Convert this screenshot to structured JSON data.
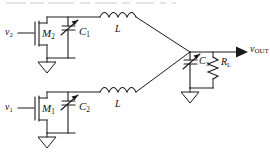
{
  "diagram": {
    "type": "circuit-schematic",
    "background_color": "#ffffff",
    "line_color": "#1a1a1a"
  },
  "inputs": [
    {
      "id": "v2",
      "label_main": "v",
      "label_sub": "2",
      "position": "top-left"
    },
    {
      "id": "v1",
      "label_main": "v",
      "label_sub": "1",
      "position": "bottom-left"
    }
  ],
  "transistors": [
    {
      "id": "M2",
      "label_main": "M",
      "label_sub": "2",
      "type": "nmos",
      "branch": "top"
    },
    {
      "id": "M1",
      "label_main": "M",
      "label_sub": "1",
      "type": "nmos",
      "branch": "bottom"
    }
  ],
  "capacitors": [
    {
      "id": "C1",
      "label_main": "C",
      "label_sub": "1",
      "variable": true,
      "branch": "top"
    },
    {
      "id": "C2",
      "label_main": "C",
      "label_sub": "2",
      "variable": true,
      "branch": "bottom"
    },
    {
      "id": "C3",
      "label_main": "C",
      "label_sub": "3",
      "variable": true,
      "branch": "output"
    }
  ],
  "inductors": [
    {
      "id": "L-top",
      "label_main": "L",
      "label_sub": "",
      "branch": "top",
      "turns": 4
    },
    {
      "id": "L-bottom",
      "label_main": "L",
      "label_sub": "",
      "branch": "bottom",
      "turns": 4
    }
  ],
  "resistors": [
    {
      "id": "RL",
      "label_main": "R",
      "label_sub": "L",
      "branch": "output"
    }
  ],
  "output": {
    "id": "vOUT",
    "label_main": "v",
    "label_sub": "OUT",
    "arrow": true
  },
  "grounds": [
    {
      "id": "gnd-top",
      "branch": "top"
    },
    {
      "id": "gnd-bottom",
      "branch": "bottom"
    },
    {
      "id": "gnd-output",
      "branch": "output"
    }
  ]
}
